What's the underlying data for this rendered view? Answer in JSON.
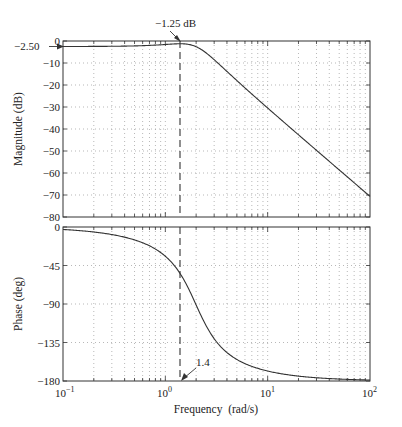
{
  "chart_data": [
    {
      "type": "line",
      "title": "",
      "xlabel": "",
      "ylabel": "Magnitude (dB)",
      "xscale": "log",
      "xlim": [
        0.1,
        100
      ],
      "ylim": [
        -80,
        0
      ],
      "yticks": [
        0,
        -10,
        -20,
        -30,
        -40,
        -50,
        -60,
        -70,
        -80
      ],
      "ytick_labels": [
        "0",
        "−10",
        "−20",
        "−30",
        "−40",
        "−50",
        "−60",
        "−70",
        "−80"
      ],
      "grid": true,
      "series": [
        {
          "name": "Magnitude",
          "model": {
            "K_dB": -2.5,
            "wn": 1.98,
            "zeta": 0.5
          },
          "x": [
            0.1,
            0.2,
            0.5,
            1.0,
            1.4,
            2.0,
            3.0,
            5.0,
            10,
            20,
            50,
            100
          ],
          "values": [
            -2.5,
            -2.4,
            -2.0,
            -1.5,
            -1.25,
            -2.5,
            -7.5,
            -15.6,
            -27.9,
            -40.3,
            -56.3,
            -70.3
          ]
        }
      ],
      "annotations": [
        {
          "text": "−1.25 dB",
          "x": 1.4,
          "y": -1.25
        },
        {
          "text": "−2.50",
          "x": 0.1,
          "y": -2.5
        }
      ]
    },
    {
      "type": "line",
      "title": "",
      "xlabel": "Frequency  (rad/s)",
      "ylabel": "Phase (deg)",
      "xscale": "log",
      "xlim": [
        0.1,
        100
      ],
      "ylim": [
        -180,
        0
      ],
      "yticks": [
        0,
        -45,
        -90,
        -135,
        -180
      ],
      "ytick_labels": [
        "0",
        "−45",
        "−90",
        "−135",
        "−180"
      ],
      "xticks": [
        0.1,
        1,
        10,
        100
      ],
      "grid": true,
      "series": [
        {
          "name": "Phase",
          "x": [
            0.1,
            0.2,
            0.5,
            1.0,
            1.4,
            2.0,
            3.0,
            5.0,
            10,
            20,
            50,
            100
          ],
          "values": [
            -2.9,
            -5.8,
            -15.0,
            -33.7,
            -51.5,
            -90.3,
            -125.3,
            -153.3,
            -168.4,
            -174.3,
            -177.7,
            -178.9
          ]
        }
      ],
      "annotations": [
        {
          "text": "1.4",
          "x": 1.4,
          "y": -180
        }
      ]
    }
  ],
  "magnitude_plot": {
    "ylabel": "Magnitude (dB)",
    "ytick_labels": [
      "0",
      "−10",
      "−20",
      "−30",
      "−40",
      "−50",
      "−60",
      "−70",
      "−80"
    ],
    "annotation_peak": "−1.25 dB",
    "annotation_dc": "−2.50"
  },
  "phase_plot": {
    "ylabel": "Phase (deg)",
    "ytick_labels": [
      "0",
      "−45",
      "−90",
      "−135",
      "−180"
    ],
    "annotation_freq": "1.4"
  },
  "x_axis": {
    "label": "Frequency  (rad/s)",
    "tick_bases": [
      "10",
      "10",
      "10",
      "10"
    ],
    "tick_exps": [
      "−1",
      "0",
      "1",
      "2"
    ]
  },
  "colors": {
    "line": "#333333",
    "grid": "#9a9a9a",
    "axis": "#333333"
  }
}
